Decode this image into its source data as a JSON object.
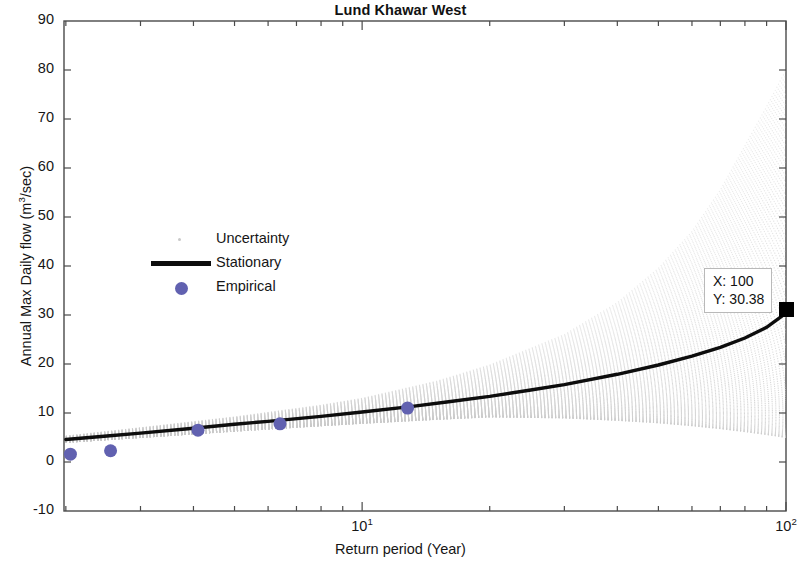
{
  "chart_data": {
    "type": "line",
    "title": "Lund Khawar West",
    "xlabel": "Return period (Year)",
    "ylabel": "Annual Max  Daily flow (m3/sec)",
    "ylabel_base": "Annual Max  Daily flow (m",
    "ylabel_sup": "3",
    "ylabel_tail": "/sec)",
    "xscale": "log",
    "yscale": "linear",
    "xlim": [
      1.98,
      100
    ],
    "ylim": [
      -10,
      90
    ],
    "grid": false,
    "legend_position": "inside-left-middle",
    "y_ticks": [
      -10,
      0,
      10,
      20,
      30,
      40,
      50,
      60,
      70,
      80,
      90
    ],
    "y_tick_labels": [
      "-10",
      "0",
      "10",
      "20",
      "30",
      "40",
      "50",
      "60",
      "70",
      "80",
      "90"
    ],
    "x_ticks": [
      10,
      100
    ],
    "x_tick_labels": [
      "10",
      "100"
    ],
    "x_tick_mantissa": "10",
    "x_tick_exponents": [
      "1",
      "2"
    ],
    "x_minor_ticks": [
      2,
      3,
      4,
      5,
      6,
      7,
      8,
      9,
      20,
      30,
      40,
      50,
      60,
      70,
      80,
      90
    ],
    "legend": [
      {
        "label": "Uncertainty",
        "marker": "dot",
        "color": "#c9c9c9"
      },
      {
        "label": "Stationary",
        "marker": "line",
        "color": "#0d0d0d"
      },
      {
        "label": "Empirical",
        "marker": "circle",
        "color": "#6161b0"
      }
    ],
    "series": [
      {
        "name": "Stationary",
        "type": "line",
        "color": "#0d0d0d",
        "linewidth": 3,
        "x": [
          2,
          2.5,
          3,
          4,
          5,
          6,
          8,
          10,
          13,
          16,
          20,
          25,
          30,
          40,
          50,
          60,
          70,
          80,
          90,
          100
        ],
        "y": [
          4.6,
          5.3,
          5.9,
          6.9,
          7.7,
          8.3,
          9.3,
          10.2,
          11.3,
          12.3,
          13.4,
          14.7,
          15.8,
          17.9,
          19.8,
          21.6,
          23.4,
          25.3,
          27.5,
          30.38
        ]
      },
      {
        "name": "Empirical",
        "type": "scatter",
        "color": "#6161b0",
        "markersize": 13,
        "x": [
          2.05,
          2.55,
          4.1,
          6.4,
          12.8
        ],
        "y": [
          1.6,
          2.3,
          6.5,
          7.8,
          11.0
        ]
      },
      {
        "name": "Uncertainty",
        "type": "band",
        "color": "#c9c9c9",
        "description": "Dotted grey ensemble of simulated quantile curves fanning out with return period",
        "x": [
          2,
          3,
          5,
          8,
          10,
          15,
          20,
          30,
          40,
          50,
          60,
          70,
          80,
          90,
          100
        ],
        "y_upper": [
          5.3,
          7.0,
          9.2,
          11.6,
          13.0,
          16.5,
          19.8,
          26.0,
          32.5,
          39.5,
          47.0,
          55.5,
          64.5,
          72.5,
          80.0
        ],
        "y_lower": [
          4.0,
          5.0,
          6.3,
          7.4,
          7.9,
          8.7,
          9.2,
          9.0,
          8.5,
          8.0,
          7.4,
          6.8,
          6.2,
          5.6,
          5.0
        ]
      }
    ],
    "annotations": [
      {
        "name": "data-tip",
        "x_label": "X: 100",
        "y_label": "Y: 30.38",
        "x_value": 100,
        "y_value": 30.38,
        "marker": "black-square"
      }
    ]
  },
  "colors": {
    "axis": "#4a4a4a",
    "line": "#0d0d0d",
    "empirical": "#6161b0",
    "uncertainty": "#c9c9c9",
    "background": "#ffffff",
    "text": "#161616"
  }
}
